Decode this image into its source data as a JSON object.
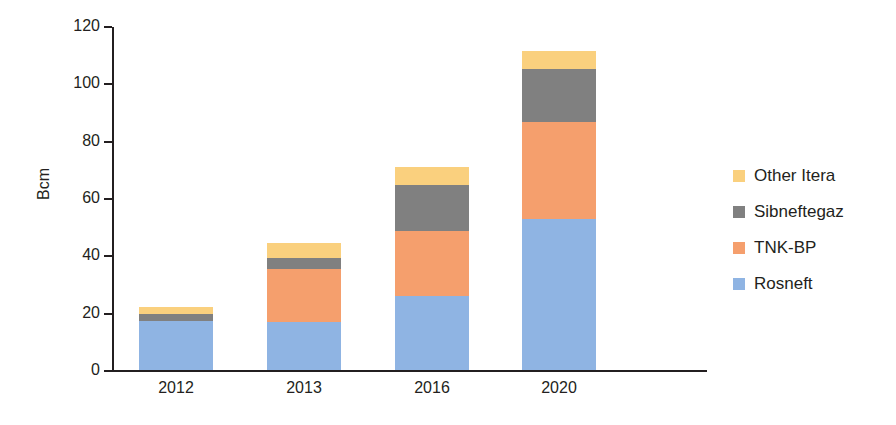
{
  "chart_data": {
    "type": "bar",
    "subtype": "stacked-bar",
    "title": "",
    "xlabel": "",
    "ylabel": "Bcm",
    "ylim": [
      0,
      120
    ],
    "yticks": [
      0,
      20,
      40,
      60,
      80,
      100,
      120
    ],
    "ytick_labels": [
      "0",
      "20",
      "40",
      "60",
      "80",
      "100",
      "120"
    ],
    "grid": false,
    "legend_position": "right",
    "categories": [
      "2012",
      "2013",
      "2016",
      "2020"
    ],
    "series": [
      {
        "name": "Rosneft",
        "color": "#8fb4e3",
        "values": [
          17.5,
          17,
          26,
          53
        ]
      },
      {
        "name": "TNK-BP",
        "color": "#f59f6d",
        "values": [
          0,
          18.5,
          23,
          34
        ]
      },
      {
        "name": "Sibneftegaz",
        "color": "#808080",
        "values": [
          2.5,
          4,
          16,
          18.5
        ]
      },
      {
        "name": "Other Itera",
        "color": "#fad07e",
        "values": [
          2.5,
          5,
          6,
          6
        ]
      }
    ],
    "totals": [
      22.5,
      44.5,
      71,
      111.5
    ],
    "legend_entries": [
      "Other Itera",
      "Sibneftegaz",
      "TNK-BP",
      "Rosneft"
    ]
  },
  "axes": {
    "y_title": "Bcm",
    "y_tick_labels": [
      "120",
      "100",
      "80",
      "60",
      "40",
      "20",
      "0"
    ],
    "x_tick_labels": [
      "2012",
      "2013",
      "2016",
      "2020"
    ]
  },
  "legend": {
    "items": [
      {
        "label": "Other Itera",
        "color": "#fad07e"
      },
      {
        "label": "Sibneftegaz",
        "color": "#808080"
      },
      {
        "label": "TNK-BP",
        "color": "#f59f6d"
      },
      {
        "label": "Rosneft",
        "color": "#8fb4e3"
      }
    ]
  }
}
